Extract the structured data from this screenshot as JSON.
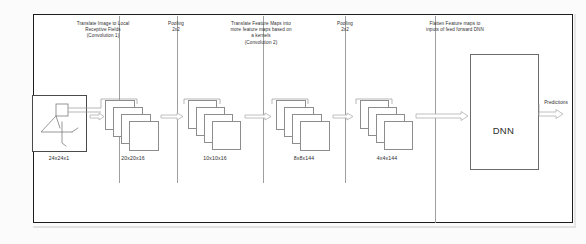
{
  "diagram": {
    "stage_captions": [
      {
        "id": "conv1",
        "text": "Translate Image to Local\nReceptive Fields\n(Convolution 1)"
      },
      {
        "id": "pool1",
        "text": "Pooling\n2x2"
      },
      {
        "id": "conv2",
        "text": "Translate Feature Maps into\nmore feature maps based on\na kernels\n(Convolution 2)"
      },
      {
        "id": "pool2",
        "text": "Pooling\n2x2"
      },
      {
        "id": "flatten",
        "text": "Flatten Feature maps to\ninputs of feed forward DNN"
      }
    ],
    "stage_dimensions": [
      {
        "id": "input",
        "text": "24x24x1"
      },
      {
        "id": "conv1",
        "text": "20x20x16"
      },
      {
        "id": "pool1",
        "text": "10x10x16"
      },
      {
        "id": "conv2",
        "text": "8x8x144"
      },
      {
        "id": "pool2",
        "text": "4x4x144"
      }
    ],
    "dnn": {
      "label": "DNN",
      "output_label": "Predictions"
    },
    "colors": {
      "frame": "#1d1d1d",
      "separator": "#9f9f9f",
      "card_stroke": "#8d8d8d",
      "arrow_stroke": "#b4b4b4",
      "text": "#2e2e2e",
      "background": "#ffffff"
    }
  }
}
